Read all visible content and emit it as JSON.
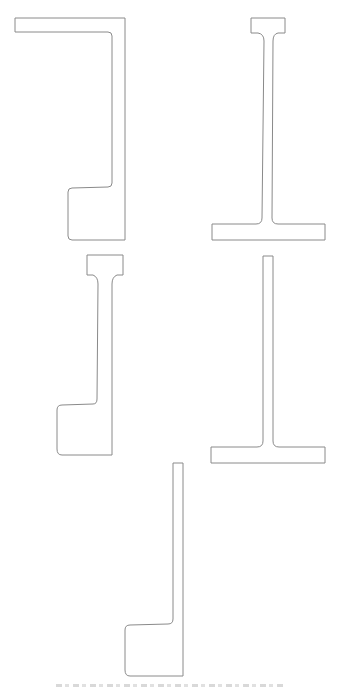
{
  "figure": {
    "background": "#ffffff",
    "stroke_color": "#8a8a8a",
    "profiles": [
      {
        "id": "profile-1",
        "type": "channel-with-top-flange-and-bottom-lip",
        "position": "top-left"
      },
      {
        "id": "profile-2",
        "type": "i-section-unequal-flanges",
        "position": "top-right"
      },
      {
        "id": "profile-3",
        "type": "web-with-top-flange-and-bottom-lip",
        "position": "middle-left"
      },
      {
        "id": "profile-4",
        "type": "inverted-t-section",
        "position": "middle-right"
      },
      {
        "id": "profile-5",
        "type": "web-with-bottom-lip",
        "position": "bottom-center"
      }
    ],
    "caption": {
      "visible": "partially cropped, illegible"
    }
  }
}
